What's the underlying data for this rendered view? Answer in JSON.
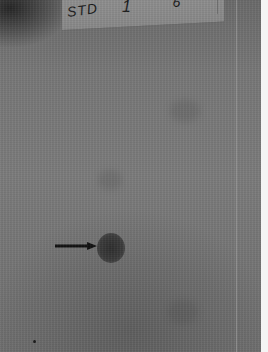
{
  "image": {
    "subject": "TLC plate photograph",
    "lane_labels": [
      "STD",
      "1",
      "6"
    ],
    "annotation": {
      "type": "arrow",
      "points_to": "dark spot"
    },
    "colors": {
      "plate": "#777777",
      "spot": "#2e2e2e",
      "arrow": "#111111",
      "border": "#f4f4f4"
    }
  }
}
